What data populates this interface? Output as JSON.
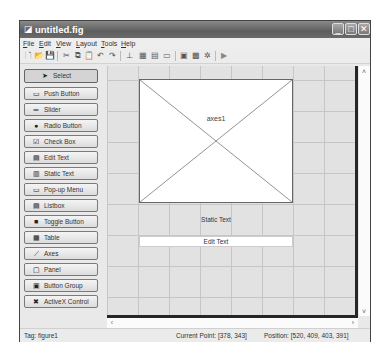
{
  "window": {
    "title": "untitled.fig",
    "controls": {
      "minimize": "_",
      "maximize": "□",
      "close": "✕"
    }
  },
  "menubar": {
    "items": [
      {
        "label": "File",
        "mnemonic": "F",
        "rest": "ile"
      },
      {
        "label": "Edit",
        "mnemonic": "E",
        "rest": "dit"
      },
      {
        "label": "View",
        "mnemonic": "V",
        "rest": "iew"
      },
      {
        "label": "Layout",
        "mnemonic": "L",
        "rest": "ayout"
      },
      {
        "label": "Tools",
        "mnemonic": "T",
        "rest": "ools"
      },
      {
        "label": "Help",
        "mnemonic": "H",
        "rest": "elp"
      }
    ]
  },
  "toolbar": {
    "icons": [
      {
        "name": "new-icon",
        "glyph": "🗋"
      },
      {
        "name": "open-icon",
        "glyph": "📂"
      },
      {
        "name": "save-icon",
        "glyph": "💾"
      },
      {
        "name": "cut-icon",
        "glyph": "✂"
      },
      {
        "name": "copy-icon",
        "glyph": "⧉"
      },
      {
        "name": "paste-icon",
        "glyph": "📋"
      },
      {
        "name": "undo-icon",
        "glyph": "↶"
      },
      {
        "name": "redo-icon",
        "glyph": "↷"
      },
      {
        "name": "align-objects-icon",
        "glyph": "⊥"
      },
      {
        "name": "menu-editor-icon",
        "glyph": "▦"
      },
      {
        "name": "tab-order-editor-icon",
        "glyph": "▤"
      },
      {
        "name": "toolbar-editor-icon",
        "glyph": "▭"
      },
      {
        "name": "m-file-editor-icon",
        "glyph": "▣"
      },
      {
        "name": "property-inspector-icon",
        "glyph": "▩"
      },
      {
        "name": "object-browser-icon",
        "glyph": "✲"
      },
      {
        "name": "run-figure-icon",
        "glyph": "▶"
      }
    ]
  },
  "palette": {
    "items": [
      {
        "label": "Select",
        "icon": "select-arrow-icon",
        "glyph": "➤",
        "selected": true
      },
      {
        "label": "Push Button",
        "icon": "push-button-icon",
        "glyph": "▭"
      },
      {
        "label": "Slider",
        "icon": "slider-icon",
        "glyph": "═"
      },
      {
        "label": "Radio Button",
        "icon": "radio-button-icon",
        "glyph": "●"
      },
      {
        "label": "Check Box",
        "icon": "check-box-icon",
        "glyph": "☑"
      },
      {
        "label": "Edit Text",
        "icon": "edit-text-icon",
        "glyph": "▤"
      },
      {
        "label": "Static Text",
        "icon": "static-text-icon",
        "glyph": "▥"
      },
      {
        "label": "Pop-up Menu",
        "icon": "popup-menu-icon",
        "glyph": "▭"
      },
      {
        "label": "Listbox",
        "icon": "listbox-icon",
        "glyph": "▤"
      },
      {
        "label": "Toggle Button",
        "icon": "toggle-button-icon",
        "glyph": "■"
      },
      {
        "label": "Table",
        "icon": "table-icon",
        "glyph": "▦"
      },
      {
        "label": "Axes",
        "icon": "axes-icon",
        "glyph": "⟋"
      },
      {
        "label": "Panel",
        "icon": "panel-icon",
        "glyph": "▢"
      },
      {
        "label": "Button Group",
        "icon": "button-group-icon",
        "glyph": "▣"
      },
      {
        "label": "ActiveX Control",
        "icon": "activex-control-icon",
        "glyph": "✖"
      }
    ]
  },
  "canvas": {
    "axes_label": "axes1",
    "static_text": "Static Text",
    "edit_text": "Edit Text"
  },
  "scrollbars": {
    "up": "˄",
    "down": "˅",
    "left": "‹",
    "right": "›"
  },
  "statusbar": {
    "tag": "Tag: figure1",
    "current_point": "Current Point: [378, 343]",
    "position": "Position: [520, 409, 403, 391]"
  }
}
